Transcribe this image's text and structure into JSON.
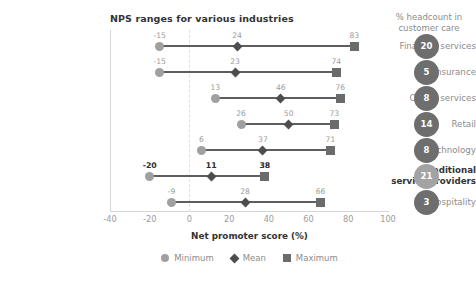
{
  "header": {
    "chart_title": "NPS ranges for various industries",
    "side_title": "% headcount in customer care"
  },
  "legend": {
    "items": [
      {
        "label": "Minimum",
        "marker": "circle-icon"
      },
      {
        "label": "Mean",
        "marker": "diamond-icon"
      },
      {
        "label": "Maximum",
        "marker": "square-icon"
      }
    ]
  },
  "colors": {
    "minimum": "#a0a0a0",
    "mean": "#4d4d4d",
    "maximum": "#6b6b6b",
    "line": "#5e5e5e",
    "badge": "#6e6e6e",
    "badge_highlight": "#a3a3a3",
    "text": "#8c8c8c",
    "text_dark": "#333333",
    "zero_gridline": "#e2e2dc"
  },
  "chart_data": {
    "type": "bar",
    "subtype": "dumbbell-range",
    "title": "NPS ranges for various industries",
    "xlabel": "Net promoter score (%)",
    "ylabel": "",
    "xlim": [
      -40,
      100
    ],
    "xticks": [
      -40,
      -20,
      0,
      20,
      40,
      60,
      80,
      100
    ],
    "xtick_labels": [
      "-40",
      "-20",
      "0",
      "20",
      "40",
      "60",
      "80",
      "100"
    ],
    "grid": false,
    "zero_line": 0,
    "legend_position": "bottom",
    "categories": [
      "Financial services",
      "Insurance",
      "Online services",
      "Retail",
      "Technology",
      "Traditional service providers",
      "Hospitality"
    ],
    "highlight_category": "Traditional service providers",
    "series": [
      {
        "name": "Minimum",
        "values": [
          -15,
          -15,
          13,
          26,
          6,
          -20,
          -9
        ]
      },
      {
        "name": "Mean",
        "values": [
          24,
          23,
          46,
          50,
          37,
          11,
          28
        ]
      },
      {
        "name": "Maximum",
        "values": [
          83,
          74,
          76,
          73,
          71,
          38,
          66
        ]
      }
    ],
    "side_panel": {
      "title": "% headcount in customer care",
      "values": [
        20,
        5,
        8,
        14,
        8,
        21,
        3
      ],
      "highlight_index": 5
    }
  }
}
